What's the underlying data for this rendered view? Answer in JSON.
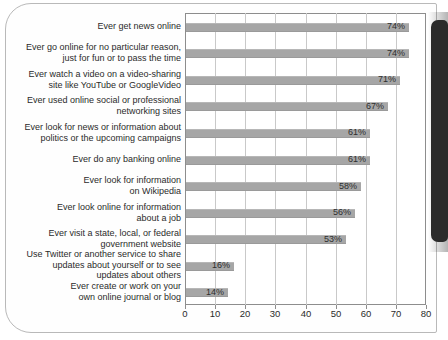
{
  "chart_data": {
    "type": "bar",
    "orientation": "horizontal",
    "title": "",
    "xlabel": "",
    "ylabel": "",
    "xlim": [
      0,
      80
    ],
    "xticks": [
      0,
      10,
      20,
      30,
      40,
      50,
      60,
      70,
      80
    ],
    "grid": true,
    "legend": false,
    "value_suffix": "%",
    "bar_color": "#a6a6a6",
    "categories": [
      "Ever get news online",
      "Ever go online for no particular reason,\njust for fun or to pass the time",
      "Ever watch a video on a video-sharing\nsite like YouTube or GoogleVideo",
      "Ever used online social or professional\nnetworking sites",
      "Ever look for news or information about\npolitics or the upcoming campaigns",
      "Ever do any banking online",
      "Ever look for information\non Wikipedia",
      "Ever look online for information\nabout a job",
      "Ever visit a state, local, or federal\ngovernment website",
      "Use Twitter or another service to share\nupdates about yourself or to see\nupdates about others",
      "Ever create or work on your\nown online journal or blog"
    ],
    "values": [
      74,
      74,
      71,
      67,
      61,
      61,
      58,
      56,
      53,
      16,
      14
    ],
    "value_labels": [
      "74%",
      "74%",
      "71%",
      "67%",
      "61%",
      "61%",
      "58%",
      "56%",
      "53%",
      "16%",
      "14%"
    ],
    "tick_labels": [
      "0",
      "10",
      "20",
      "30",
      "40",
      "50",
      "60",
      "70",
      "80"
    ]
  }
}
